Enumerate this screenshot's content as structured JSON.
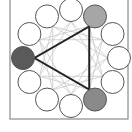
{
  "diagram": {
    "type": "circular-node-diagram",
    "frame": {
      "x": 10,
      "y": -2,
      "width": 118,
      "height": 121,
      "stroke": "#8a8a8a"
    },
    "ring": {
      "cx": 71,
      "cy": 58,
      "r": 48,
      "node_radius": 11.5,
      "node_count": 12
    },
    "nodes": [
      {
        "index": 0,
        "position": "12-oclock",
        "fill": "#ffffff"
      },
      {
        "index": 1,
        "position": "1-oclock",
        "fill": "#a6a6a6",
        "highlighted": true
      },
      {
        "index": 2,
        "position": "2-oclock",
        "fill": "#ffffff"
      },
      {
        "index": 3,
        "position": "3-oclock",
        "fill": "#ffffff"
      },
      {
        "index": 4,
        "position": "4-oclock",
        "fill": "#ffffff"
      },
      {
        "index": 5,
        "position": "5-oclock",
        "fill": "#8a8a8a",
        "highlighted": true
      },
      {
        "index": 6,
        "position": "6-oclock",
        "fill": "#ffffff"
      },
      {
        "index": 7,
        "position": "7-oclock",
        "fill": "#ffffff"
      },
      {
        "index": 8,
        "position": "8-oclock",
        "fill": "#ffffff"
      },
      {
        "index": 9,
        "position": "9-oclock",
        "fill": "#5a5a5a",
        "highlighted": true
      },
      {
        "index": 10,
        "position": "10-oclock",
        "fill": "#ffffff"
      },
      {
        "index": 11,
        "position": "11-oclock",
        "fill": "#ffffff"
      }
    ],
    "triangle": {
      "vertices": [
        1,
        5,
        9
      ],
      "stroke": "#222222",
      "stroke_width": 2
    },
    "chords": {
      "steps": [
        3,
        4
      ],
      "stroke": "#c8c8c8",
      "stroke_width": 0.8
    },
    "node_stroke": "#555555"
  }
}
